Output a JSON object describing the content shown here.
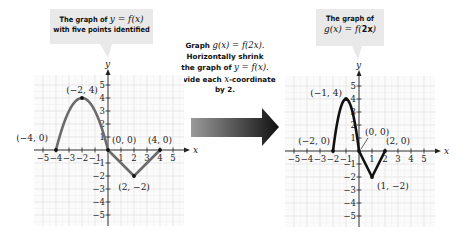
{
  "left_callout": {
    "line1_prefix": "The graph of ",
    "line1_math": "y = f(x)",
    "line2": "with five points identified"
  },
  "right_callout": {
    "line1": "The graph of",
    "line2_math_prefix": "g(x) = f(",
    "line2_math_bold": "2x",
    "line2_math_suffix": ")"
  },
  "middle_instruction": {
    "line1_prefix": "Graph ",
    "line1_math": "g(x) = f(2x).",
    "line2": "Horizontally shrink",
    "line3_prefix": "the graph of ",
    "line3_math": "y = f(x).",
    "line4_prefix": "Divide each ",
    "line4_math": "x",
    "line4_suffix": "-coordinate",
    "line5": "by 2."
  },
  "arrow": {
    "icon": "right-arrow-icon",
    "gradient_start": "#9a9a9a",
    "gradient_end": "#111111"
  },
  "left_graph": {
    "curve_label": "y = f(x)",
    "axis_x_label": "x",
    "axis_y_label": "y",
    "x_ticks": [
      "−5",
      "−4",
      "−3",
      "−2",
      "−1",
      "1",
      "2",
      "3",
      "4",
      "5"
    ],
    "y_ticks": [
      "5",
      "4",
      "3",
      "2",
      "1",
      "−1",
      "−2",
      "−3",
      "−4",
      "−5"
    ],
    "points": [
      {
        "label": "(−4, 0)",
        "x": -4,
        "y": 0
      },
      {
        "label": "(−2, 4)",
        "x": -2,
        "y": 4
      },
      {
        "label": "(0, 0)",
        "x": 0,
        "y": 0
      },
      {
        "label": "(2, −2)",
        "x": 2,
        "y": -2
      },
      {
        "label": "(4, 0)",
        "x": 4,
        "y": 0
      }
    ],
    "curve_color": "#6b6b6b"
  },
  "right_graph": {
    "curve_label_prefix": "g(x) = f(",
    "curve_label_bold": "2x",
    "curve_label_suffix": ")",
    "axis_x_label": "x",
    "axis_y_label": "y",
    "x_ticks": [
      "−5",
      "−4",
      "−3",
      "−2",
      "−1",
      "1",
      "2",
      "3",
      "4",
      "5"
    ],
    "y_ticks": [
      "5",
      "4",
      "3",
      "2",
      "1",
      "−1",
      "−2",
      "−3",
      "−4",
      "−5"
    ],
    "points": [
      {
        "label": "(−2, 0)",
        "x": -2,
        "y": 0
      },
      {
        "label": "(−1, 4)",
        "x": -1,
        "y": 4
      },
      {
        "label": "(0, 0)",
        "x": 0,
        "y": 0
      },
      {
        "label": "(1, −2)",
        "x": 1,
        "y": -2
      },
      {
        "label": "(2, 0)",
        "x": 2,
        "y": 0
      }
    ],
    "curve_color": "#111111"
  },
  "chart_data": [
    {
      "type": "line",
      "title": "The graph of y = f(x) with five points identified",
      "xlabel": "x",
      "ylabel": "y",
      "xlim": [
        -5,
        5
      ],
      "ylim": [
        -5,
        5
      ],
      "grid": true,
      "series": [
        {
          "name": "y = f(x)",
          "x": [
            -4,
            -2,
            0,
            2,
            4
          ],
          "y": [
            0,
            4,
            0,
            -2,
            0
          ]
        }
      ],
      "annotations": [
        "(−4, 0)",
        "(−2, 4)",
        "(0, 0)",
        "(2, −2)",
        "(4, 0)"
      ]
    },
    {
      "type": "line",
      "title": "The graph of g(x) = f(2x)",
      "xlabel": "x",
      "ylabel": "y",
      "xlim": [
        -5,
        5
      ],
      "ylim": [
        -5,
        5
      ],
      "grid": true,
      "series": [
        {
          "name": "g(x) = f(2x)",
          "x": [
            -2,
            -1,
            0,
            1,
            2
          ],
          "y": [
            0,
            4,
            0,
            -2,
            0
          ]
        }
      ],
      "annotations": [
        "(−2, 0)",
        "(−1, 4)",
        "(0, 0)",
        "(1, −2)",
        "(2, 0)"
      ]
    }
  ]
}
